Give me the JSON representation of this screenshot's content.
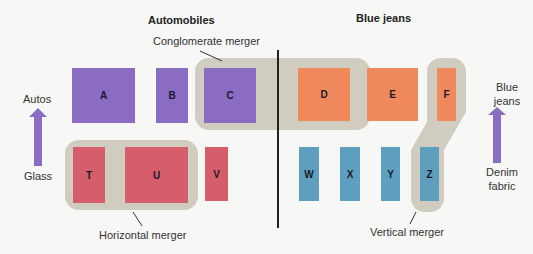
{
  "headings": {
    "left": "Automobiles",
    "right": "Blue jeans"
  },
  "callouts": {
    "conglomerate": "Conglomerate merger",
    "horizontal": "Horizontal merger",
    "vertical": "Vertical merger"
  },
  "axes": {
    "left": {
      "top": "Autos",
      "bottom": "Glass"
    },
    "right": {
      "top": "Blue jeans",
      "bottom": "Denim fabric"
    }
  },
  "firms": {
    "autos": [
      "A",
      "B",
      "C"
    ],
    "glass": [
      "T",
      "U",
      "V"
    ],
    "jeans": [
      "D",
      "E",
      "F"
    ],
    "denim": [
      "W",
      "X",
      "Y",
      "Z"
    ]
  },
  "colors": {
    "autos": "#8a6cc2",
    "jeans": "#f08a5d",
    "glass": "#d55e6a",
    "denim": "#5e9fbf",
    "merger_shape": "#d0ccbf",
    "arrow": "#8a6cc2"
  }
}
